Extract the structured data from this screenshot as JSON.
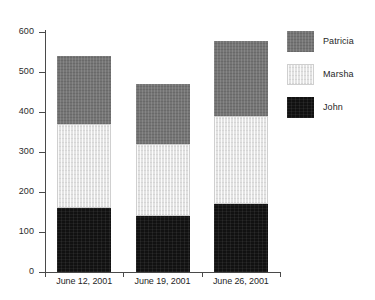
{
  "chart_data": {
    "type": "bar",
    "stacked": true,
    "title": "",
    "xlabel": "",
    "ylabel": "",
    "categories": [
      "June 12, 2001",
      "June 19, 2001",
      "June 26, 2001"
    ],
    "series": [
      {
        "name": "John",
        "color": "#111111",
        "values": [
          160,
          140,
          170
        ]
      },
      {
        "name": "Marsha",
        "color": "#e2e2e2",
        "values": [
          210,
          180,
          220
        ]
      },
      {
        "name": "Patricia",
        "color": "#757575",
        "values": [
          170,
          150,
          188
        ]
      }
    ],
    "totals": [
      540,
      470,
      578
    ],
    "ylim": [
      0,
      600
    ],
    "yticks": [
      0,
      100,
      200,
      300,
      400,
      500,
      600
    ],
    "ytick_labels": [
      "0",
      "100",
      "200",
      "300",
      "400",
      "500",
      "600"
    ],
    "grid": false,
    "legend_position": "right",
    "legend_entries": [
      "Patricia",
      "Marsha",
      "John"
    ]
  },
  "axis": {
    "tick_labels": [
      "600",
      "500",
      "400",
      "300",
      "200",
      "100",
      "0"
    ]
  },
  "legend": {
    "items": [
      {
        "label": "Patricia"
      },
      {
        "label": "Marsha"
      },
      {
        "label": "John"
      }
    ]
  }
}
